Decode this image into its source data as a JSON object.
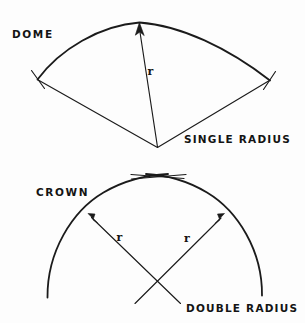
{
  "page": {
    "background_color": "#fdfdfd",
    "ink_color": "#1b1b1b",
    "width": 305,
    "height": 323
  },
  "figures": [
    {
      "id": "dome",
      "name_label": "DOME",
      "method_label": "SINGLE RADIUS",
      "radius_label": "r",
      "description": "Fan shaped sector: one arc with two straight radius lines meeting at a single center point below, arrow on radius pointing up to the arc apex",
      "radius_count": 1,
      "center_points": 1
    },
    {
      "id": "crown",
      "name_label": "CROWN",
      "method_label": "DOUBLE RADIUS",
      "radius_labels": [
        "r",
        "r"
      ],
      "description": "Two arcs crossing at the apex, with two radius lines crossing each other below, each arrow pointing up-outward to its own arc",
      "radius_count": 2,
      "center_points": 2
    }
  ],
  "labels": {
    "dome": "DOME",
    "single_radius": "SINGLE RADIUS",
    "crown": "CROWN",
    "double_radius": "DOUBLE RADIUS",
    "r_dome": "r",
    "r_crown_left": "r",
    "r_crown_right": "r"
  }
}
